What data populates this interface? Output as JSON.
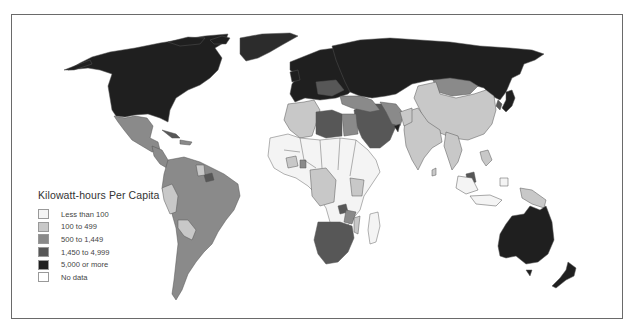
{
  "map": {
    "title": "Kilowatt-hours Per Capita",
    "type": "choropleth",
    "region": "World"
  },
  "legend": {
    "title": "Kilowatt-hours Per Capita",
    "items": [
      {
        "label": "Less than 100",
        "color": "#f4f4f4"
      },
      {
        "label": "100 to 499",
        "color": "#c8c8c8"
      },
      {
        "label": "500 to 1,449",
        "color": "#8a8a8a"
      },
      {
        "label": "1,450 to 4,999",
        "color": "#575757"
      },
      {
        "label": "5,000 or more",
        "color": "#1f1f1f"
      },
      {
        "label": "No data",
        "color": "#ffffff"
      }
    ]
  },
  "colors": {
    "frame": "#6a6a6a",
    "border_lines": "#555555"
  }
}
